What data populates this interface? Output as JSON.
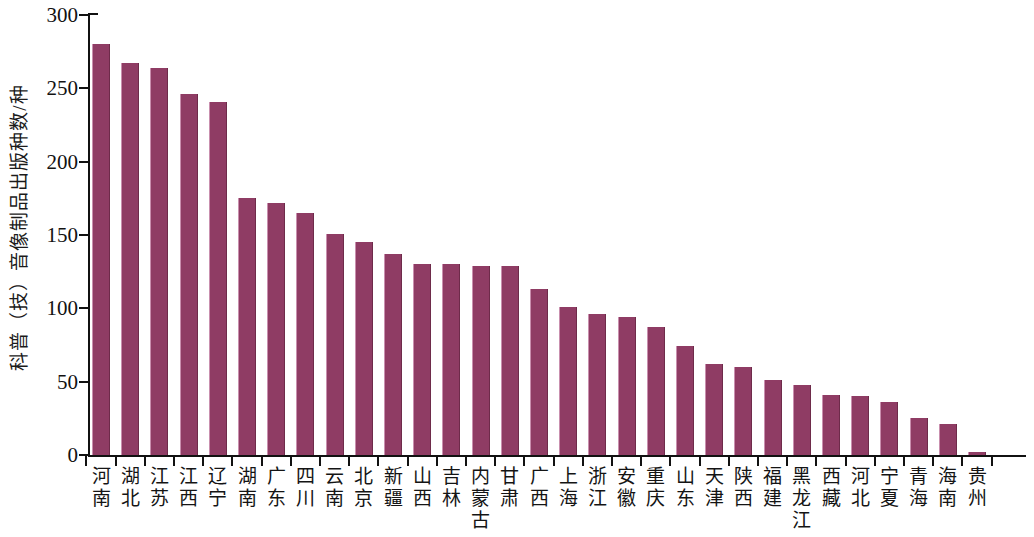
{
  "chart_data": {
    "type": "bar",
    "title": "",
    "subtitle": "",
    "xlabel": "",
    "ylabel": "科普（技）音像制品出版种数/种",
    "ylim": [
      0,
      300
    ],
    "ytick_values": [
      0,
      50,
      100,
      150,
      200,
      250,
      300
    ],
    "ytick_labels": [
      "0",
      "50",
      "100",
      "150",
      "200",
      "250",
      "300"
    ],
    "grid": false,
    "legend": null,
    "legend_position": "none",
    "bar_color": "#8f3c64",
    "axis_color": "#111111",
    "categories": [
      "河南",
      "湖北",
      "江苏",
      "江西",
      "辽宁",
      "湖南",
      "广东",
      "四川",
      "云南",
      "北京",
      "新疆",
      "山西",
      "吉林",
      "内蒙古",
      "甘肃",
      "广西",
      "上海",
      "浙江",
      "安徽",
      "重庆",
      "山东",
      "天津",
      "陕西",
      "福建",
      "黑龙江",
      "西藏",
      "河北",
      "宁夏",
      "青海",
      "海南",
      "贵州"
    ],
    "values": [
      280,
      267,
      264,
      246,
      241,
      175,
      172,
      165,
      151,
      145,
      137,
      130,
      130,
      129,
      129,
      113,
      101,
      96,
      94,
      87,
      74,
      62,
      60,
      51,
      48,
      41,
      40,
      36,
      25,
      21,
      2
    ]
  }
}
